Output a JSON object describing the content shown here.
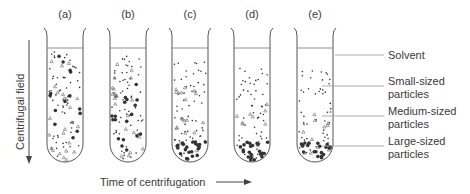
{
  "figure": {
    "tubes": [
      {
        "id": "a",
        "label": "(a)",
        "solvent_top": 48,
        "small_top": 50,
        "medium_top": 50,
        "large_top": 50
      },
      {
        "id": "b",
        "label": "(b)",
        "solvent_top": 48,
        "small_top": 54,
        "medium_top": 60,
        "large_top": 75
      },
      {
        "id": "c",
        "label": "(c)",
        "solvent_top": 48,
        "small_top": 60,
        "medium_top": 75,
        "large_top": 138
      },
      {
        "id": "d",
        "label": "(d)",
        "solvent_top": 48,
        "small_top": 65,
        "medium_top": 100,
        "large_top": 138
      },
      {
        "id": "e",
        "label": "(e)",
        "solvent_top": 48,
        "small_top": 68,
        "medium_top": 110,
        "large_top": 138
      }
    ],
    "axis_y_label": "Centrifugal field",
    "axis_x_label": "Time of centrifugation",
    "legend": [
      {
        "label_line1": "Solvent",
        "label_line2": ""
      },
      {
        "label_line1": "Small-sized",
        "label_line2": "particles"
      },
      {
        "label_line1": "Medium-sized",
        "label_line2": "particles"
      },
      {
        "label_line1": "Large-sized",
        "label_line2": "particles"
      }
    ],
    "colors": {
      "ink": "#333333",
      "line": "#9a9a9a"
    }
  }
}
